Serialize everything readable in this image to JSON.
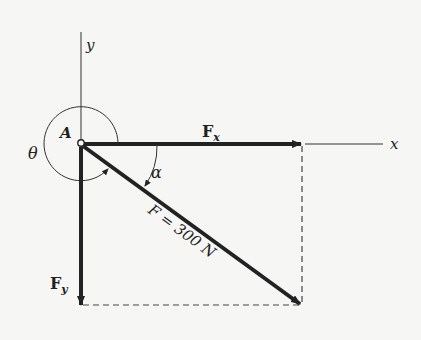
{
  "diagram": {
    "point_label": "A",
    "axes": {
      "x_label": "x",
      "y_label": "y"
    },
    "components": {
      "fx_label": "F",
      "fx_sub": "x",
      "fy_label": "F",
      "fy_sub": "y"
    },
    "force": {
      "label": "F = 300 N",
      "magnitude": "300 N"
    },
    "angles": {
      "theta": "θ",
      "alpha": "α"
    },
    "colors": {
      "ink": "#222222",
      "background": "#f6f6f4"
    }
  }
}
